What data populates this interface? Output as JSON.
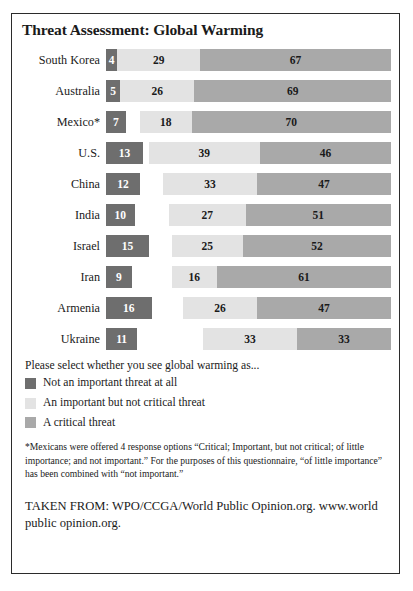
{
  "chart_data": {
    "type": "bar",
    "title": "Threat Assessment: Global Warming",
    "subtype": "stacked-horizontal-bar",
    "xlabel": "",
    "ylabel": "",
    "xlim": [
      0,
      100
    ],
    "grid": false,
    "legend_position": "below",
    "units": "percent",
    "categories": [
      "South Korea",
      "Australia",
      "Mexico*",
      "U.S.",
      "China",
      "India",
      "Israel",
      "Iran",
      "Armenia",
      "Ukraine"
    ],
    "series": [
      {
        "name": "Not an important threat at all",
        "color": "#6e6e6e",
        "values": [
          4,
          5,
          7,
          13,
          12,
          10,
          15,
          9,
          16,
          11
        ]
      },
      {
        "name": "An important but not critical threat",
        "color": "#e3e3e3",
        "values": [
          29,
          26,
          18,
          39,
          33,
          27,
          25,
          16,
          26,
          33
        ]
      },
      {
        "name": "A critical threat",
        "color": "#a9a9a9",
        "values": [
          67,
          69,
          70,
          46,
          47,
          51,
          52,
          61,
          47,
          33
        ]
      }
    ],
    "legend": [
      "Not an important threat at all",
      "An important but not critical threat",
      "A critical threat"
    ]
  },
  "legend_prompt": "Please select whether you see global warming as...",
  "footnote": "*Mexicans were offered 4 response options “Critical; Important, but not critical; of little importance; and not important.” For the purposes of this questionnaire, “of little importance” has been combined with “not important.”",
  "source": "TAKEN FROM: WPO/CCGA/World Public Opinion.org. www.world public opinion.org."
}
